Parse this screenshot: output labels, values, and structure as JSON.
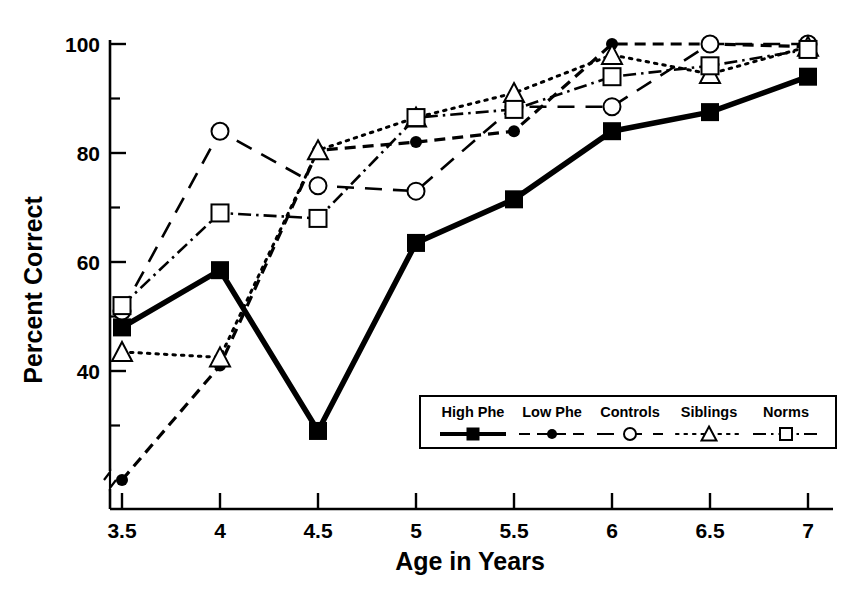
{
  "chart_data": {
    "type": "line",
    "title": "",
    "xlabel": "Age in Years",
    "ylabel": "Percent Correct",
    "x": [
      3.5,
      4,
      4.5,
      5,
      5.5,
      6,
      6.5,
      7
    ],
    "xticklabels": [
      "3.5",
      "4",
      "4.5",
      "5",
      "5.5",
      "6",
      "6.5",
      "7"
    ],
    "yticklabels": [
      "40",
      "60",
      "80",
      "100"
    ],
    "yticks": [
      40,
      60,
      80,
      100
    ],
    "yminorticks": [
      30,
      50,
      70,
      90
    ],
    "xlim": [
      3.5,
      7
    ],
    "ylim": [
      18,
      103
    ],
    "grid": false,
    "axis_break": true,
    "legend_position": "inside-lower-right",
    "series": [
      {
        "name": "High Phe",
        "marker": "filled-square",
        "line": "solid",
        "color": "#000000",
        "values": [
          48,
          58.5,
          29,
          63.5,
          71.5,
          84,
          87.5,
          94
        ]
      },
      {
        "name": "Low Phe",
        "marker": "filled-circle",
        "line": "dashed",
        "color": "#000000",
        "values": [
          20,
          41,
          80.5,
          82,
          84,
          100,
          100,
          99.5
        ]
      },
      {
        "name": "Controls",
        "marker": "open-circle",
        "line": "long-dashed",
        "color": "#000000",
        "values": [
          51,
          84,
          74,
          73,
          88.5,
          88.5,
          100,
          100
        ]
      },
      {
        "name": "Siblings",
        "marker": "open-triangle",
        "line": "dotted",
        "color": "#000000",
        "values": [
          43.5,
          42.5,
          80.5,
          86.5,
          91,
          98,
          94.5,
          99.5
        ]
      },
      {
        "name": "Norms",
        "marker": "open-square",
        "line": "dash-dot",
        "color": "#000000",
        "values": [
          52,
          69,
          68,
          86.5,
          88,
          94,
          96,
          99
        ]
      }
    ]
  },
  "legend": {
    "items": [
      {
        "label": "High Phe"
      },
      {
        "label": "Low Phe"
      },
      {
        "label": "Controls"
      },
      {
        "label": "Siblings"
      },
      {
        "label": "Norms"
      }
    ]
  },
  "axes": {
    "ylabel": "Percent Correct",
    "xlabel": "Age in Years",
    "y": [
      "100",
      "80",
      "60",
      "40"
    ],
    "x": [
      "3.5",
      "4",
      "4.5",
      "5",
      "5.5",
      "6",
      "6.5",
      "7"
    ]
  }
}
